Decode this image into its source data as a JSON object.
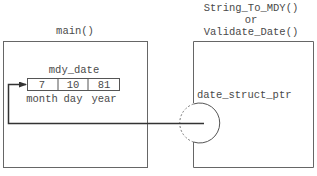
{
  "diagram": {
    "main_box": {
      "label": "main()",
      "variable": {
        "name": "mdy_date",
        "fields": [
          {
            "value": "7",
            "label": "month"
          },
          {
            "value": "10",
            "label": "day"
          },
          {
            "value": "81",
            "label": "year"
          }
        ]
      }
    },
    "callee_box": {
      "label_line1": "String_To_MDY()",
      "label_line2": "or",
      "label_line3": "Validate_Date()",
      "parameter": "date_struct_ptr"
    },
    "colors": {
      "stroke": "#555555",
      "text": "#4a4a4a",
      "background": "#ffffff"
    }
  }
}
